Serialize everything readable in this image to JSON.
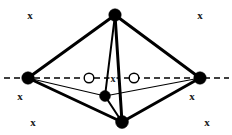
{
  "figure": {
    "canvas": {
      "width": 232,
      "height": 135
    },
    "colors": {
      "stroke": "#000000",
      "fill_vertex": "#000000",
      "open_vertex_fill": "#ffffff",
      "background": "#ffffff",
      "label_color": "#1a1a1a"
    },
    "axis": {
      "name": "horizontal-dashed-axis",
      "style": "dashed",
      "y": 78,
      "x_start": 4,
      "x_end": 229,
      "dash_pattern": "6,4",
      "width": 1.6
    },
    "vertices": [
      {
        "id": "top",
        "label": "top-vertex",
        "x": 115,
        "y": 15,
        "r": 6.2,
        "type": "filled"
      },
      {
        "id": "left",
        "label": "left-vertex",
        "x": 28,
        "y": 78,
        "r": 6.2,
        "type": "filled"
      },
      {
        "id": "right",
        "label": "right-vertex",
        "x": 200,
        "y": 78,
        "r": 6.2,
        "type": "filled"
      },
      {
        "id": "bottom",
        "label": "bottom-vertex",
        "x": 122,
        "y": 122,
        "r": 6.4,
        "type": "filled"
      },
      {
        "id": "inner",
        "label": "inner-vertex",
        "x": 105,
        "y": 96,
        "r": 5.4,
        "type": "filled"
      },
      {
        "id": "open-left",
        "label": "open-circle-left",
        "x": 89,
        "y": 78,
        "r": 4.8,
        "type": "open"
      },
      {
        "id": "open-right",
        "label": "open-circle-right",
        "x": 134,
        "y": 78,
        "r": 4.8,
        "type": "open"
      }
    ],
    "edges": [
      {
        "from": "top",
        "to": "left",
        "width": 3.0,
        "name": "edge-top-left"
      },
      {
        "from": "top",
        "to": "right",
        "width": 3.0,
        "name": "edge-top-right"
      },
      {
        "from": "top",
        "to": "bottom",
        "width": 3.0,
        "name": "edge-top-bottom"
      },
      {
        "from": "top",
        "to": "inner",
        "width": 2.0,
        "name": "edge-top-inner"
      },
      {
        "from": "left",
        "to": "bottom",
        "width": 3.0,
        "name": "edge-left-bottom"
      },
      {
        "from": "right",
        "to": "bottom",
        "width": 3.0,
        "name": "edge-right-bottom"
      },
      {
        "from": "left",
        "to": "inner",
        "width": 1.2,
        "name": "edge-left-inner"
      },
      {
        "from": "right",
        "to": "inner",
        "width": 1.2,
        "name": "edge-right-inner"
      },
      {
        "from": "inner",
        "to": "bottom",
        "width": 2.0,
        "name": "edge-inner-bottom"
      }
    ],
    "labels": [
      {
        "id": "x-top-left",
        "text": "x",
        "x": 30,
        "y": 15,
        "name": "label-x-top-left"
      },
      {
        "id": "x-top-right",
        "text": "x",
        "x": 200,
        "y": 15,
        "name": "label-x-top-right"
      },
      {
        "id": "x-mid-left",
        "text": "x",
        "x": 20,
        "y": 96,
        "name": "label-x-mid-left"
      },
      {
        "id": "x-mid-right",
        "text": "x",
        "x": 192,
        "y": 96,
        "name": "label-x-mid-right"
      },
      {
        "id": "x-bottom-left",
        "text": "x",
        "x": 33,
        "y": 122,
        "name": "label-x-bottom-left"
      },
      {
        "id": "x-bottom-right",
        "text": "x",
        "x": 207,
        "y": 122,
        "name": "label-x-bottom-right"
      },
      {
        "id": "x-center",
        "text": "x",
        "x": 113,
        "y": 78,
        "name": "label-x-center"
      }
    ]
  }
}
